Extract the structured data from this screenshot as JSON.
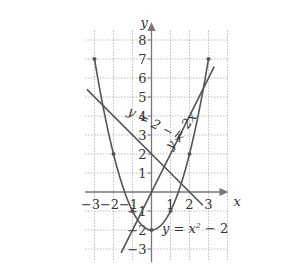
{
  "chart_data": {
    "type": "line",
    "title": "",
    "xlabel": "x",
    "ylabel": "y",
    "xlim": [
      -3.5,
      4
    ],
    "ylim": [
      -3.6,
      8.6
    ],
    "grid": true,
    "x_ticks": [
      "−3",
      "−2",
      "−1",
      "1",
      "2",
      "3"
    ],
    "y_ticks": [
      "8",
      "7",
      "6",
      "5",
      "4",
      "3",
      "2",
      "1",
      "−1",
      "−2",
      "−3"
    ],
    "series": [
      {
        "name": "y = x² − 2",
        "label_parts": {
          "lhs": "y = x",
          "sup": "2",
          "rhs": " − 2"
        },
        "domain": [
          -3,
          3
        ],
        "marked_points": [
          [
            -3,
            7
          ],
          [
            -2,
            2
          ],
          [
            -1,
            -1
          ],
          [
            0,
            -2
          ],
          [
            1,
            -1
          ],
          [
            2,
            2
          ],
          [
            3,
            7
          ]
        ]
      },
      {
        "name": "y = 2x",
        "label": "y = 2x",
        "domain": [
          -1.6,
          3.3
        ],
        "points": [
          [
            -1.6,
            -3.2
          ],
          [
            3.3,
            6.6
          ]
        ]
      },
      {
        "name": "y = 2 − x",
        "label": "y = 2 − x",
        "domain": [
          -3.4,
          2.7
        ],
        "points": [
          [
            -3.4,
            5.4
          ],
          [
            2.7,
            -0.7
          ]
        ]
      }
    ],
    "colors": {
      "curve": "#555555",
      "grid": "#bdbdbd",
      "axis": "#777777",
      "text": "#333333"
    }
  }
}
